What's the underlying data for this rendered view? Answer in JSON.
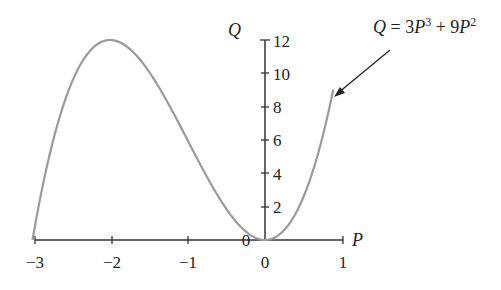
{
  "chart_data": {
    "type": "line",
    "title": "",
    "xlabel": "P",
    "ylabel": "Q",
    "xlim": [
      -3,
      1
    ],
    "ylim": [
      0,
      12
    ],
    "grid": false,
    "x_ticks": [
      "−3",
      "−2",
      "−1",
      "0",
      "1"
    ],
    "y_ticks": [
      "2",
      "4",
      "6",
      "8",
      "10",
      "12"
    ],
    "origin_label": "0",
    "series": [
      {
        "name": "Q = 3P^3 + 9P^2",
        "color": "#999999",
        "x": [
          -3,
          -2.5,
          -2,
          -1.5,
          -1,
          -0.5,
          0,
          0.5,
          0.8,
          0.88
        ],
        "y": [
          0,
          9.375,
          12,
          10.125,
          6,
          1.875,
          0,
          2.625,
          7.296,
          9.015
        ]
      }
    ],
    "annotations": [
      {
        "text_parts": {
          "q": "Q",
          "eq": " = 3",
          "p1": "P",
          "e1": "3",
          "plus": " + 9",
          "p2": "P",
          "e2": "2"
        },
        "arrow_target": {
          "P": 0.85,
          "Q": 8.4
        }
      }
    ]
  }
}
